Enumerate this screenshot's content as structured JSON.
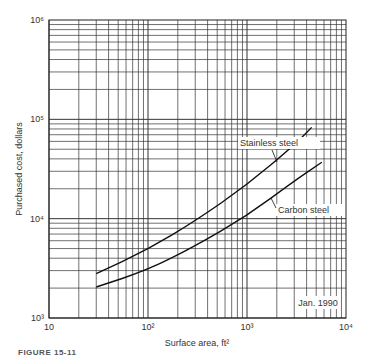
{
  "chart_data": {
    "type": "line",
    "title": "",
    "xlabel": "Surface area, ft²",
    "ylabel": "Purchased cost, dollars",
    "xscale": "log",
    "yscale": "log",
    "xlim": [
      10,
      10000
    ],
    "ylim": [
      1000,
      1000000
    ],
    "x_tick_labels": [
      "10",
      "10²",
      "10³",
      "10⁴"
    ],
    "y_tick_labels": [
      "10³",
      "10⁴",
      "10⁵",
      "10⁶"
    ],
    "grid": true,
    "annotation": "Jan. 1990",
    "series": [
      {
        "name": "Stainless steel",
        "x": [
          30,
          100,
          300,
          1000,
          3000,
          4500
        ],
        "y": [
          2800,
          4900,
          9500,
          21800,
          55000,
          83000
        ]
      },
      {
        "name": "Carbon steel",
        "x": [
          30,
          100,
          300,
          1000,
          3000,
          5700
        ],
        "y": [
          2050,
          3050,
          5300,
          10700,
          24000,
          37000
        ]
      }
    ]
  },
  "figure_caption": "FIGURE 15-11"
}
